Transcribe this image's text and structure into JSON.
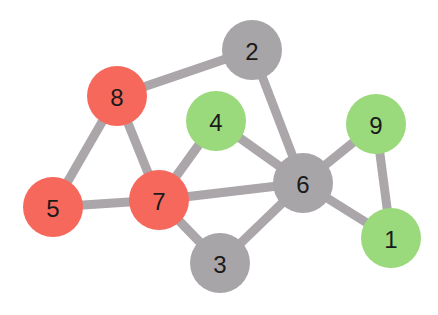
{
  "colors": {
    "red": "#f7685c",
    "green": "#9ad97c",
    "gray": "#a8a5a8",
    "edge": "#aaa6aa"
  },
  "nodes": [
    {
      "id": "1",
      "label": "1",
      "x": 391,
      "y": 238,
      "color": "green"
    },
    {
      "id": "2",
      "label": "2",
      "x": 252,
      "y": 50,
      "color": "gray"
    },
    {
      "id": "3",
      "label": "3",
      "x": 220,
      "y": 263,
      "color": "gray"
    },
    {
      "id": "4",
      "label": "4",
      "x": 216,
      "y": 121,
      "color": "green"
    },
    {
      "id": "5",
      "label": "5",
      "x": 53,
      "y": 207,
      "color": "red"
    },
    {
      "id": "6",
      "label": "6",
      "x": 303,
      "y": 183,
      "color": "gray"
    },
    {
      "id": "7",
      "label": "7",
      "x": 159,
      "y": 200,
      "color": "red"
    },
    {
      "id": "8",
      "label": "8",
      "x": 117,
      "y": 96,
      "color": "red"
    },
    {
      "id": "9",
      "label": "9",
      "x": 376,
      "y": 124,
      "color": "green"
    }
  ],
  "edges": [
    [
      "8",
      "2"
    ],
    [
      "8",
      "5"
    ],
    [
      "8",
      "7"
    ],
    [
      "5",
      "7"
    ],
    [
      "7",
      "4"
    ],
    [
      "7",
      "6"
    ],
    [
      "7",
      "3"
    ],
    [
      "2",
      "6"
    ],
    [
      "4",
      "6"
    ],
    [
      "3",
      "6"
    ],
    [
      "6",
      "9"
    ],
    [
      "6",
      "1"
    ],
    [
      "9",
      "1"
    ]
  ]
}
